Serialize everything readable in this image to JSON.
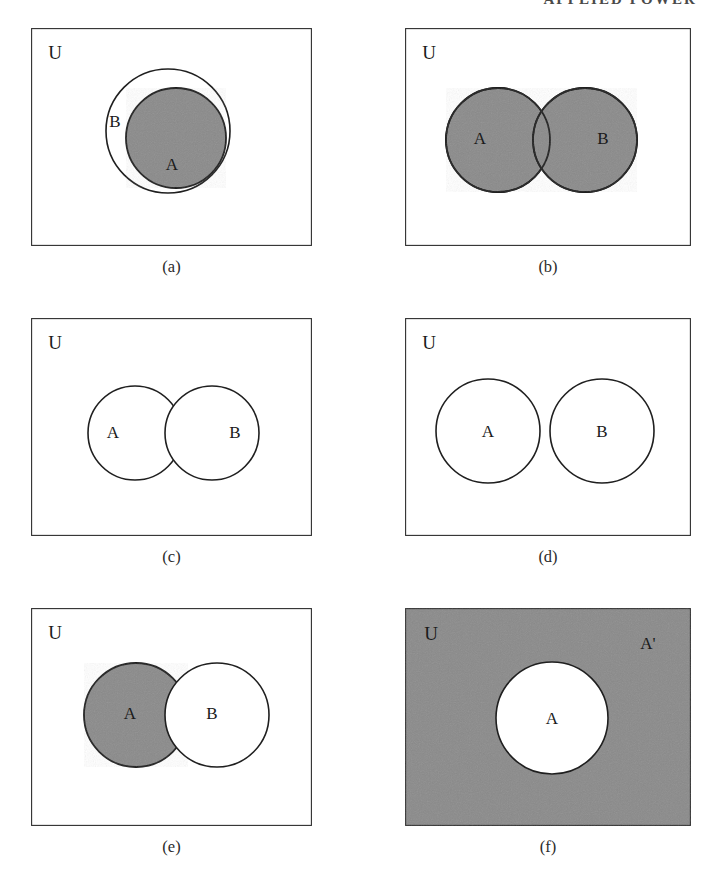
{
  "page": {
    "running_head": "APPLIED POWER",
    "universe_label": "U",
    "set_a_label": "A",
    "set_b_label": "B",
    "complement_label": "A'",
    "gray_fill": "#8a8a8a",
    "stroke_color": "#1f1f1f",
    "background": "#ffffff"
  },
  "panels": [
    {
      "id": "a",
      "caption": "(a)",
      "description": "A is a proper subset of B; A shaded",
      "universe_label": "U",
      "shaded_region": "A",
      "labels": [
        "U",
        "B",
        "A"
      ]
    },
    {
      "id": "b",
      "caption": "(b)",
      "description": "Union of A and B; both circles shaded",
      "universe_label": "U",
      "shaded_region": "A union B",
      "labels": [
        "U",
        "A",
        "B"
      ]
    },
    {
      "id": "c",
      "caption": "(c)",
      "description": "Intersection of A and B; overlap lens shaded",
      "universe_label": "U",
      "shaded_region": "A intersect B",
      "labels": [
        "U",
        "A",
        "B"
      ]
    },
    {
      "id": "d",
      "caption": "(d)",
      "description": "A and B disjoint; nothing shaded",
      "universe_label": "U",
      "shaded_region": "none",
      "labels": [
        "U",
        "A",
        "B"
      ]
    },
    {
      "id": "e",
      "caption": "(e)",
      "description": "Difference A minus B; A shaded, B unshaded on top",
      "universe_label": "U",
      "shaded_region": "A minus B",
      "labels": [
        "U",
        "A",
        "B"
      ]
    },
    {
      "id": "f",
      "caption": "(f)",
      "description": "Complement of A; universe shaded, A unshaded",
      "universe_label": "U",
      "shaded_region": "A complement",
      "labels": [
        "U",
        "A'",
        "A"
      ]
    }
  ]
}
